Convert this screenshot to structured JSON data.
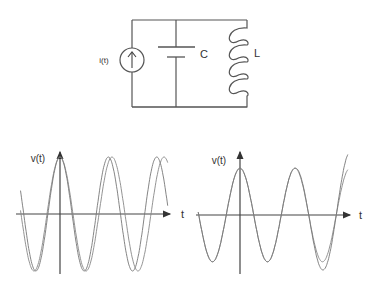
{
  "circuit": {
    "source_label": "i(t)",
    "capacitor_label": "C",
    "inductor_label": "L",
    "source_icon": "current-source-up-arrow-icon"
  },
  "plots": [
    {
      "id": "left",
      "ylabel": "v(t)",
      "xlabel": "t",
      "description": "Two nearly identical cosine waveforms; the second drifts slightly in phase/frequency over time",
      "series": [
        {
          "name": "reference",
          "amplitude": 1.0,
          "period": 1.0,
          "phase": 0.0,
          "growth": 0.0
        },
        {
          "name": "shifted",
          "amplitude": 1.0,
          "period": 0.93,
          "phase": 0.0,
          "growth": 0.0
        }
      ],
      "t_range": [
        -0.78,
        2.2
      ]
    },
    {
      "id": "right",
      "ylabel": "v(t)",
      "xlabel": "t",
      "description": "Two cosine waveforms; the second grows in amplitude over time",
      "series": [
        {
          "name": "reference",
          "amplitude": 0.85,
          "period": 1.0,
          "phase": 0.0,
          "growth": 0.0
        },
        {
          "name": "growing",
          "amplitude": 0.85,
          "period": 1.0,
          "phase": 0.0,
          "growth": 0.35
        }
      ],
      "t_range": [
        -0.8,
        2.2
      ]
    }
  ]
}
